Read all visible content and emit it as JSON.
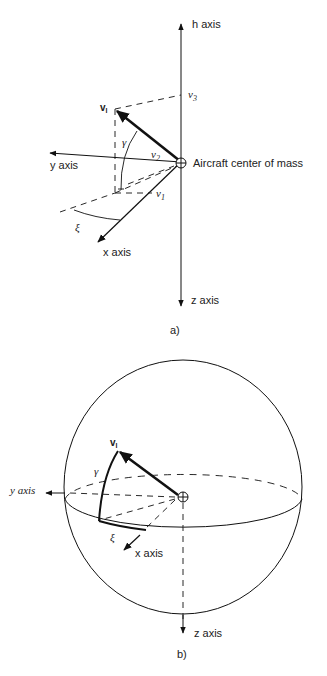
{
  "figure_a": {
    "caption": "a)",
    "axes": {
      "h": "h axis",
      "y": "y axis",
      "x": "x axis",
      "z": "z axis"
    },
    "center_label": "Aircraft center of mass",
    "vector_label": "v",
    "vector_subscript": "l",
    "components": {
      "v1": "v",
      "v1_sub": "1",
      "v2": "v",
      "v2_sub": "2",
      "v3": "v",
      "v3_sub": "3"
    },
    "angles": {
      "gamma": "γ",
      "xi": "ξ"
    }
  },
  "figure_b": {
    "caption": "b)",
    "axes": {
      "y": "y axis",
      "x": "x axis",
      "z": "z axis"
    },
    "vector_label": "v",
    "vector_subscript": "l",
    "angles": {
      "gamma": "γ",
      "xi": "ξ"
    }
  }
}
